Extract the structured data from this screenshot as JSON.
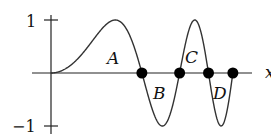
{
  "chart_data": {
    "type": "line",
    "function": "y = sin(x^2)",
    "x_axis_label": "x",
    "y_tick_labels": [
      "1",
      "−1"
    ],
    "y_ticks": [
      1,
      -1
    ],
    "ylim": [
      -1,
      1
    ],
    "xlim": [
      0,
      3.545
    ],
    "zeros_marked": [
      1.772,
      2.507,
      3.07,
      3.545
    ],
    "region_labels": [
      {
        "label": "A",
        "sign": "positive",
        "interval": [
          0,
          1.772
        ]
      },
      {
        "label": "B",
        "sign": "negative",
        "interval": [
          1.772,
          2.507
        ]
      },
      {
        "label": "C",
        "sign": "positive",
        "interval": [
          2.507,
          3.07
        ]
      },
      {
        "label": "D",
        "sign": "negative",
        "interval": [
          3.07,
          3.545
        ]
      }
    ],
    "grid": false
  },
  "labels": {
    "x_axis": "x",
    "y_top": "1",
    "y_bottom": "−1",
    "A": "A",
    "B": "B",
    "C": "C",
    "D": "D"
  }
}
